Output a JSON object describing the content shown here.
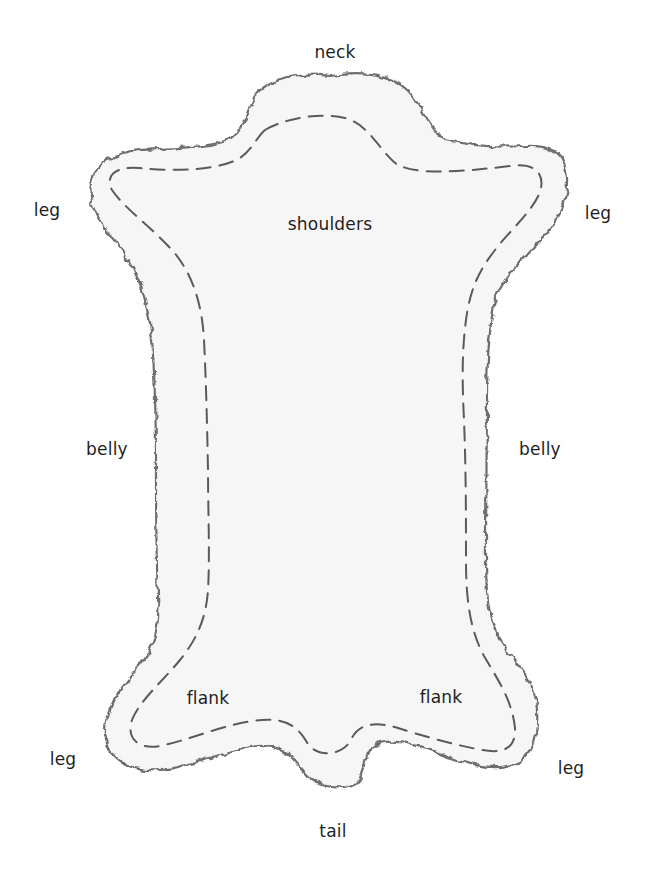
{
  "diagram": {
    "colors": {
      "background": "#ffffff",
      "outline": "#6e6e6e",
      "outline_fill": "#f4f4f4",
      "dashed_line": "#5a5a5a",
      "label_text": "#1e1e1e"
    },
    "labels": [
      {
        "id": "neck",
        "text": "neck",
        "x": 335,
        "y": 52
      },
      {
        "id": "leg-top-left",
        "text": "leg",
        "x": 47,
        "y": 210
      },
      {
        "id": "leg-top-right",
        "text": "leg",
        "x": 598,
        "y": 213
      },
      {
        "id": "shoulders",
        "text": "shoulders",
        "x": 330,
        "y": 224
      },
      {
        "id": "belly-left",
        "text": "belly",
        "x": 107,
        "y": 449
      },
      {
        "id": "belly-right",
        "text": "belly",
        "x": 540,
        "y": 449
      },
      {
        "id": "flank-left",
        "text": "flank",
        "x": 208,
        "y": 698
      },
      {
        "id": "flank-right",
        "text": "flank",
        "x": 441,
        "y": 697
      },
      {
        "id": "leg-bottom-left",
        "text": "leg",
        "x": 63,
        "y": 759
      },
      {
        "id": "leg-bottom-right",
        "text": "leg",
        "x": 571,
        "y": 768
      },
      {
        "id": "tail",
        "text": "tail",
        "x": 333,
        "y": 831
      }
    ]
  }
}
